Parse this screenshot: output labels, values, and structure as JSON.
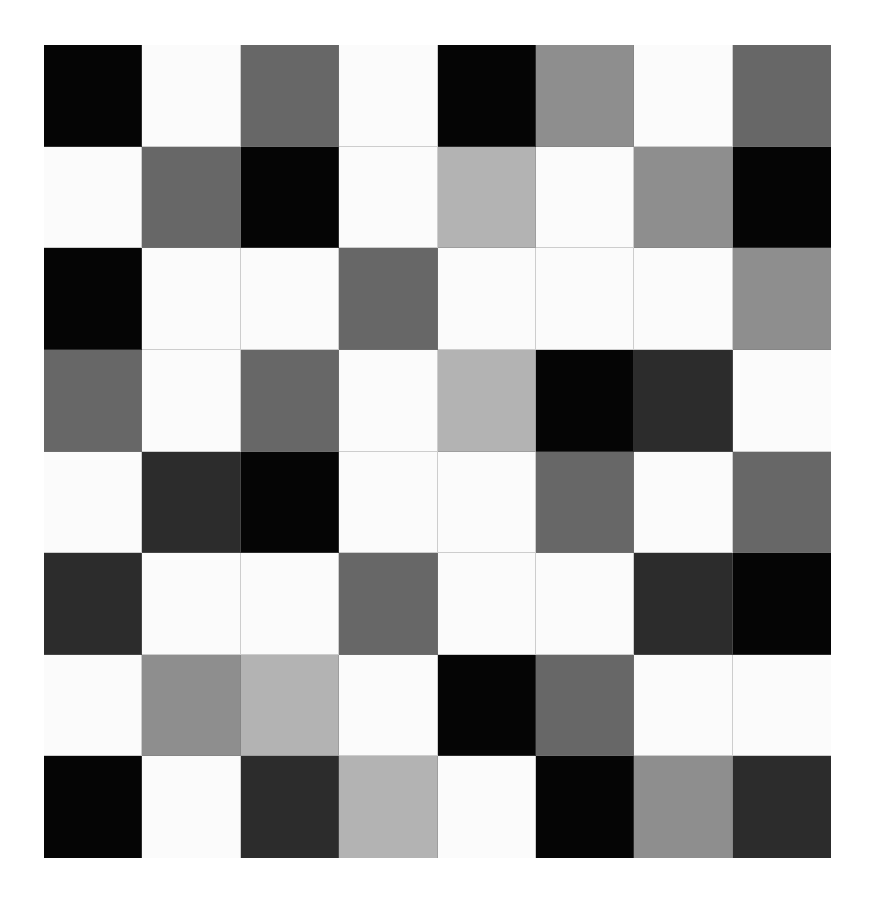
{
  "grid": {
    "rows": 8,
    "cols": 8,
    "palette": {
      "B": "#050505",
      "D": "#2c2c2c",
      "M": "#676767",
      "G": "#8e8e8e",
      "L": "#b3b3b3",
      "W": "#fbfbfb"
    },
    "cells": [
      [
        "B",
        "W",
        "M",
        "W",
        "B",
        "G",
        "W",
        "M"
      ],
      [
        "W",
        "M",
        "B",
        "W",
        "L",
        "W",
        "G",
        "B"
      ],
      [
        "B",
        "W",
        "W",
        "M",
        "W",
        "W",
        "W",
        "G"
      ],
      [
        "M",
        "W",
        "M",
        "W",
        "L",
        "B",
        "D",
        "W"
      ],
      [
        "W",
        "D",
        "B",
        "W",
        "W",
        "M",
        "W",
        "M"
      ],
      [
        "D",
        "W",
        "W",
        "M",
        "W",
        "W",
        "D",
        "B"
      ],
      [
        "W",
        "G",
        "L",
        "W",
        "B",
        "M",
        "W",
        "W"
      ],
      [
        "B",
        "W",
        "D",
        "L",
        "W",
        "B",
        "G",
        "D"
      ]
    ]
  }
}
